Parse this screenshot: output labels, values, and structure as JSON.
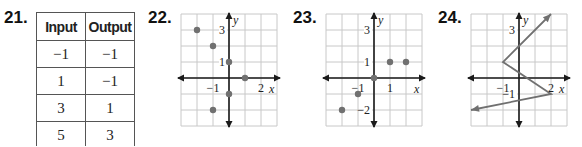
{
  "problems": [
    {
      "number": "21.",
      "type": "table",
      "headers": [
        "Input",
        "Output"
      ],
      "rows": [
        [
          "−1",
          "−1"
        ],
        [
          "1",
          "−1"
        ],
        [
          "3",
          "1"
        ],
        [
          "5",
          "3"
        ]
      ]
    },
    {
      "number": "22.",
      "type": "scatter",
      "points": [
        [
          -2,
          3
        ],
        [
          -1,
          2
        ],
        [
          0,
          1
        ],
        [
          1,
          0
        ],
        [
          0,
          -1
        ],
        [
          -1,
          -2
        ]
      ],
      "labels": {
        "y_tick": [
          "3",
          "1"
        ],
        "x_tick": [
          "−1",
          "2"
        ],
        "x_axis": "x",
        "y_axis": "y"
      }
    },
    {
      "number": "23.",
      "type": "scatter",
      "points": [
        [
          -2,
          -2
        ],
        [
          -1,
          -1
        ],
        [
          0,
          0
        ],
        [
          1,
          1
        ],
        [
          2,
          1
        ]
      ],
      "labels": {
        "y_tick": [
          "3",
          "1",
          "−2"
        ],
        "x_tick": [
          "−1",
          "1"
        ],
        "x_axis": "x",
        "y_axis": "y"
      }
    },
    {
      "number": "24.",
      "type": "line",
      "points": [
        [
          -3,
          -2
        ],
        [
          2,
          -1
        ],
        [
          -1,
          1
        ],
        [
          2,
          4
        ]
      ],
      "labels": {
        "y_tick": [
          "3",
          "−1"
        ],
        "x_tick": [
          "−1",
          "2"
        ],
        "x_axis": "x",
        "y_axis": "y"
      }
    }
  ],
  "colors": {
    "grid": "#c8c8c8",
    "axis": "#1a1a1a",
    "point": "#707070",
    "line": "#707070"
  },
  "chart_data": [
    {
      "type": "table",
      "title": "21.",
      "columns": [
        "Input",
        "Output"
      ],
      "rows": [
        [
          -1,
          -1
        ],
        [
          1,
          -1
        ],
        [
          3,
          1
        ],
        [
          5,
          3
        ]
      ]
    },
    {
      "type": "scatter",
      "title": "22.",
      "xlabel": "x",
      "ylabel": "y",
      "x": [
        -2,
        -1,
        0,
        1,
        0,
        -1
      ],
      "y": [
        3,
        2,
        1,
        0,
        -1,
        -2
      ],
      "xlim": [
        -3,
        3
      ],
      "ylim": [
        -3,
        4
      ],
      "grid": true
    },
    {
      "type": "scatter",
      "title": "23.",
      "xlabel": "x",
      "ylabel": "y",
      "x": [
        -2,
        -1,
        0,
        1,
        2
      ],
      "y": [
        -2,
        -1,
        0,
        1,
        1
      ],
      "xlim": [
        -3,
        3
      ],
      "ylim": [
        -3,
        4
      ],
      "grid": true
    },
    {
      "type": "line",
      "title": "24.",
      "xlabel": "x",
      "ylabel": "y",
      "x": [
        -3,
        2,
        -1,
        2
      ],
      "y": [
        -2,
        -1,
        1,
        4
      ],
      "xlim": [
        -3,
        3
      ],
      "ylim": [
        -3,
        4
      ],
      "grid": true,
      "arrows": "both ends"
    }
  ]
}
